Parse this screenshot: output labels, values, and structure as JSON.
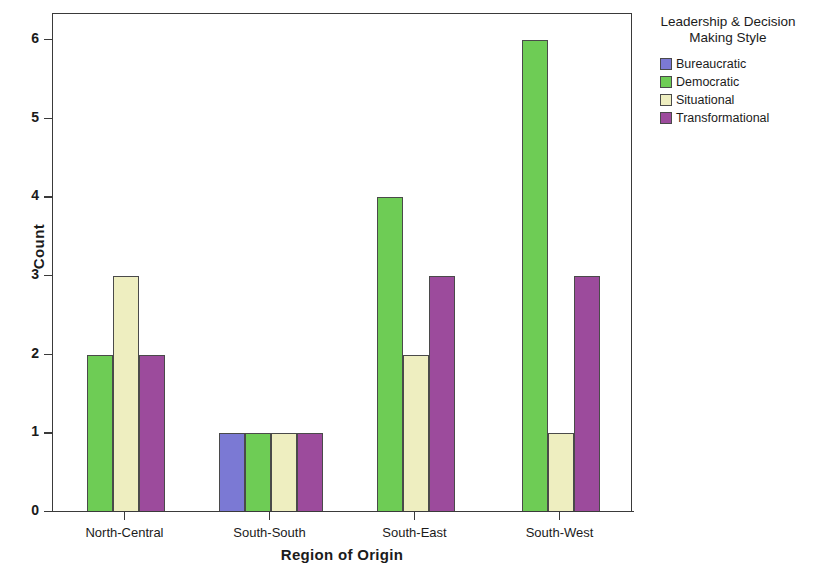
{
  "chart_data": {
    "type": "bar",
    "title": "",
    "xlabel": "Region of Origin",
    "ylabel": "Count",
    "categories": [
      "North-Central",
      "South-South",
      "South-East",
      "South-West"
    ],
    "series": [
      {
        "name": "Bureaucratic",
        "color": "#7b79d4",
        "values": [
          0,
          1,
          0,
          0
        ]
      },
      {
        "name": "Democratic",
        "color": "#6ecc55",
        "values": [
          2,
          1,
          4,
          6
        ]
      },
      {
        "name": "Situational",
        "color": "#eeeec0",
        "values": [
          3,
          1,
          2,
          1
        ]
      },
      {
        "name": "Transformational",
        "color": "#9c4b9c",
        "values": [
          2,
          1,
          3,
          3
        ]
      }
    ],
    "ylim": [
      0,
      6
    ],
    "yticks": [
      0,
      1,
      2,
      3,
      4,
      5,
      6
    ],
    "ytick_labels": [
      "0",
      "1",
      "2",
      "3",
      "4",
      "5",
      "6"
    ],
    "grid": false,
    "legend_position": "right",
    "legend_title": "Leadership & Decision Making Style"
  },
  "legend": {
    "title_line1": "Leadership & Decision",
    "title_line2": "Making Style",
    "items": [
      {
        "label": "Bureaucratic",
        "color": "#7b79d4"
      },
      {
        "label": "Democratic",
        "color": "#6ecc55"
      },
      {
        "label": "Situational",
        "color": "#eeeec0"
      },
      {
        "label": "Transformational",
        "color": "#9c4b9c"
      }
    ]
  },
  "axes": {
    "y_title": "Count",
    "x_title": "Region of Origin"
  }
}
